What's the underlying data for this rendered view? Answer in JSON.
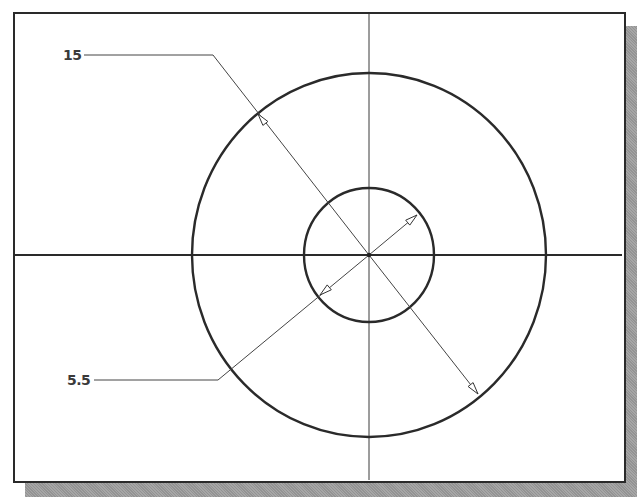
{
  "drawing": {
    "type": "cad-sketch-dimensioned-concentric-circles",
    "frame": {
      "x": 13,
      "y": 12,
      "width": 611,
      "height": 469,
      "stroke": "#2a2a2a"
    },
    "shadow": {
      "color": "#9c9c9c",
      "offset": 12
    },
    "center": {
      "x": 369,
      "y": 255
    },
    "centerlines": {
      "horizontal": {
        "y": 255,
        "x1": 15,
        "x2": 622,
        "stroke_width": 2,
        "color": "#2a2a2a"
      },
      "vertical": {
        "x": 369,
        "y1": 14,
        "y2": 480,
        "stroke_width": 1,
        "color": "#3a3a3a"
      }
    },
    "circles": [
      {
        "name": "outer-circle",
        "rx": 177,
        "ry": 182,
        "stroke_width": 2.4,
        "color": "#2a2a2a"
      },
      {
        "name": "inner-circle",
        "rx": 65,
        "ry": 67,
        "stroke_width": 2.4,
        "color": "#2a2a2a"
      }
    ],
    "dimensions": [
      {
        "name": "outer-diameter-dimension",
        "value": "15",
        "label": {
          "x": 63,
          "y": 48
        },
        "leader": {
          "x1": 84,
          "y1": 55,
          "knee_x": 213,
          "knee_y": 55
        },
        "line_end": {
          "x": 478,
          "y": 394
        },
        "arrows": [
          {
            "tip_x": 258,
            "tip_y": 114,
            "dir_x": -0.615,
            "dir_y": -0.789
          },
          {
            "tip_x": 478,
            "tip_y": 394,
            "dir_x": 0.615,
            "dir_y": 0.789
          }
        ]
      },
      {
        "name": "inner-diameter-dimension",
        "value": "5.5",
        "label": {
          "x": 67,
          "y": 373
        },
        "leader": {
          "x1": 94,
          "y1": 380,
          "knee_x": 218,
          "knee_y": 380
        },
        "line_end": {
          "x": 417,
          "y": 215
        },
        "arrows": [
          {
            "tip_x": 417,
            "tip_y": 215,
            "dir_x": 0.77,
            "dir_y": -0.638
          },
          {
            "tip_x": 320,
            "tip_y": 295,
            "dir_x": -0.77,
            "dir_y": 0.638
          }
        ]
      }
    ],
    "line_color": "#444444"
  }
}
